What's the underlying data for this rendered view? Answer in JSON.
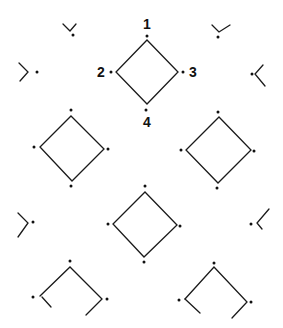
{
  "diagram": {
    "width": 283,
    "height": 328,
    "background": "#ffffff",
    "stroke_color": "#1a1a1a",
    "dot_color": "#111111",
    "labels": [
      {
        "text": "1",
        "x": 147,
        "y": 29,
        "anchor": "middle"
      },
      {
        "text": "2",
        "x": 101,
        "y": 77,
        "anchor": "middle"
      },
      {
        "text": "3",
        "x": 193,
        "y": 77,
        "anchor": "middle"
      },
      {
        "text": "4",
        "x": 147,
        "y": 127,
        "anchor": "middle"
      }
    ],
    "diamonds": [
      {
        "name": "diamond-top-center",
        "points": [
          [
            147,
            40
          ],
          [
            178,
            72
          ],
          [
            147,
            104
          ],
          [
            116,
            72
          ]
        ],
        "closed": true
      },
      {
        "name": "diamond-middle-left",
        "points": [
          [
            71,
            116
          ],
          [
            104,
            149
          ],
          [
            72,
            181
          ],
          [
            40,
            147
          ]
        ],
        "closed": true
      },
      {
        "name": "diamond-middle-right",
        "points": [
          [
            219,
            117
          ],
          [
            251,
            150
          ],
          [
            218,
            183
          ],
          [
            186,
            150
          ]
        ],
        "closed": true
      },
      {
        "name": "diamond-lower-center",
        "points": [
          [
            145,
            192
          ],
          [
            177,
            225
          ],
          [
            144,
            257
          ],
          [
            113,
            224
          ]
        ],
        "closed": true
      }
    ],
    "fragments": [
      {
        "name": "fragment-top-left-v",
        "points": [
          [
            63,
            24
          ],
          [
            70,
            31
          ],
          [
            76,
            24
          ]
        ]
      },
      {
        "name": "fragment-top-right-v",
        "points": [
          [
            212,
            25
          ],
          [
            219,
            32
          ],
          [
            230,
            25
          ]
        ]
      },
      {
        "name": "fragment-left-upper-chevron",
        "points": [
          [
            19,
            63
          ],
          [
            28,
            72
          ],
          [
            20,
            81
          ]
        ]
      },
      {
        "name": "fragment-right-upper-chevron",
        "points": [
          [
            263,
            65
          ],
          [
            255,
            74
          ],
          [
            265,
            86
          ]
        ]
      },
      {
        "name": "fragment-left-lower-chevron",
        "points": [
          [
            18,
            213
          ],
          [
            28,
            223
          ],
          [
            18,
            237
          ]
        ]
      },
      {
        "name": "fragment-right-lower-chevron",
        "points": [
          [
            269,
            209
          ],
          [
            257,
            223
          ],
          [
            262,
            229
          ]
        ]
      },
      {
        "name": "partial-bottom-left-roof",
        "points": [
          [
            40,
            296
          ],
          [
            70,
            267
          ],
          [
            102,
            299
          ],
          [
            86,
            315
          ]
        ]
      },
      {
        "name": "partial-bottom-left-stub",
        "points": [
          [
            42,
            297
          ],
          [
            51,
            307
          ]
        ]
      },
      {
        "name": "partial-bottom-right-roof",
        "points": [
          [
            185,
            299
          ],
          [
            214,
            267
          ],
          [
            247,
            302
          ],
          [
            232,
            318
          ]
        ]
      },
      {
        "name": "partial-bottom-right-stub",
        "points": [
          [
            185,
            299
          ],
          [
            200,
            313
          ]
        ]
      }
    ],
    "dots": [
      [
        73,
        35
      ],
      [
        218,
        37
      ],
      [
        37,
        72
      ],
      [
        252,
        74
      ],
      [
        147,
        36
      ],
      [
        111,
        72
      ],
      [
        183,
        72
      ],
      [
        146,
        110
      ],
      [
        71,
        110
      ],
      [
        34,
        147
      ],
      [
        108,
        149
      ],
      [
        71,
        186
      ],
      [
        218,
        112
      ],
      [
        181,
        150
      ],
      [
        254,
        151
      ],
      [
        217,
        188
      ],
      [
        145,
        186
      ],
      [
        108,
        224
      ],
      [
        180,
        226
      ],
      [
        144,
        262
      ],
      [
        33,
        222
      ],
      [
        251,
        224
      ],
      [
        70,
        261
      ],
      [
        33,
        297
      ],
      [
        107,
        299
      ],
      [
        214,
        263
      ],
      [
        179,
        300
      ],
      [
        251,
        302
      ]
    ]
  }
}
